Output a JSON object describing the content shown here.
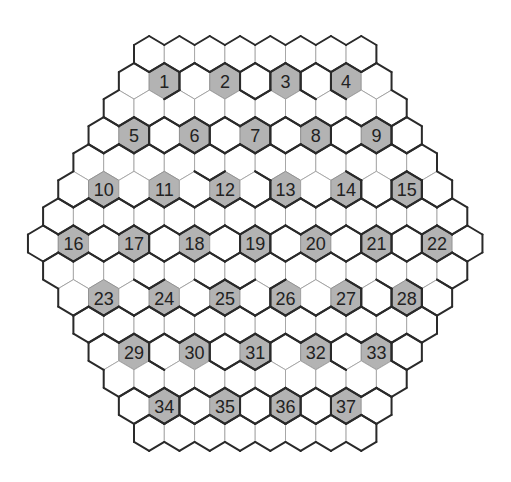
{
  "puzzle": {
    "type": "hexagonal-grid",
    "rows": 15,
    "row_lengths": [
      8,
      9,
      10,
      11,
      12,
      13,
      14,
      15,
      14,
      13,
      12,
      11,
      10,
      9,
      8
    ],
    "colors": {
      "cell_fill": "#ffffff",
      "clue_fill": "#b3b3b3",
      "grid_line": "#9a9a9a",
      "border": "#2a2a2a",
      "text": "#222222"
    },
    "clues": [
      {
        "row": 1,
        "col": 1,
        "label": "1"
      },
      {
        "row": 1,
        "col": 3,
        "label": "2"
      },
      {
        "row": 1,
        "col": 5,
        "label": "3"
      },
      {
        "row": 1,
        "col": 7,
        "label": "4"
      },
      {
        "row": 3,
        "col": 1,
        "label": "5"
      },
      {
        "row": 3,
        "col": 3,
        "label": "6"
      },
      {
        "row": 3,
        "col": 5,
        "label": "7"
      },
      {
        "row": 3,
        "col": 7,
        "label": "8"
      },
      {
        "row": 3,
        "col": 9,
        "label": "9"
      },
      {
        "row": 5,
        "col": 1,
        "label": "10"
      },
      {
        "row": 5,
        "col": 3,
        "label": "11"
      },
      {
        "row": 5,
        "col": 5,
        "label": "12"
      },
      {
        "row": 5,
        "col": 7,
        "label": "13"
      },
      {
        "row": 5,
        "col": 9,
        "label": "14"
      },
      {
        "row": 5,
        "col": 11,
        "label": "15"
      },
      {
        "row": 7,
        "col": 1,
        "label": "16"
      },
      {
        "row": 7,
        "col": 3,
        "label": "17"
      },
      {
        "row": 7,
        "col": 5,
        "label": "18"
      },
      {
        "row": 7,
        "col": 7,
        "label": "19"
      },
      {
        "row": 7,
        "col": 9,
        "label": "20"
      },
      {
        "row": 7,
        "col": 11,
        "label": "21"
      },
      {
        "row": 7,
        "col": 13,
        "label": "22"
      },
      {
        "row": 9,
        "col": 1,
        "label": "23"
      },
      {
        "row": 9,
        "col": 3,
        "label": "24"
      },
      {
        "row": 9,
        "col": 5,
        "label": "25"
      },
      {
        "row": 9,
        "col": 7,
        "label": "26"
      },
      {
        "row": 9,
        "col": 9,
        "label": "27"
      },
      {
        "row": 9,
        "col": 11,
        "label": "28"
      },
      {
        "row": 11,
        "col": 1,
        "label": "29"
      },
      {
        "row": 11,
        "col": 3,
        "label": "30"
      },
      {
        "row": 11,
        "col": 5,
        "label": "31"
      },
      {
        "row": 11,
        "col": 7,
        "label": "32"
      },
      {
        "row": 11,
        "col": 9,
        "label": "33"
      },
      {
        "row": 13,
        "col": 1,
        "label": "34"
      },
      {
        "row": 13,
        "col": 3,
        "label": "35"
      },
      {
        "row": 13,
        "col": 5,
        "label": "36"
      },
      {
        "row": 13,
        "col": 7,
        "label": "37"
      }
    ]
  }
}
